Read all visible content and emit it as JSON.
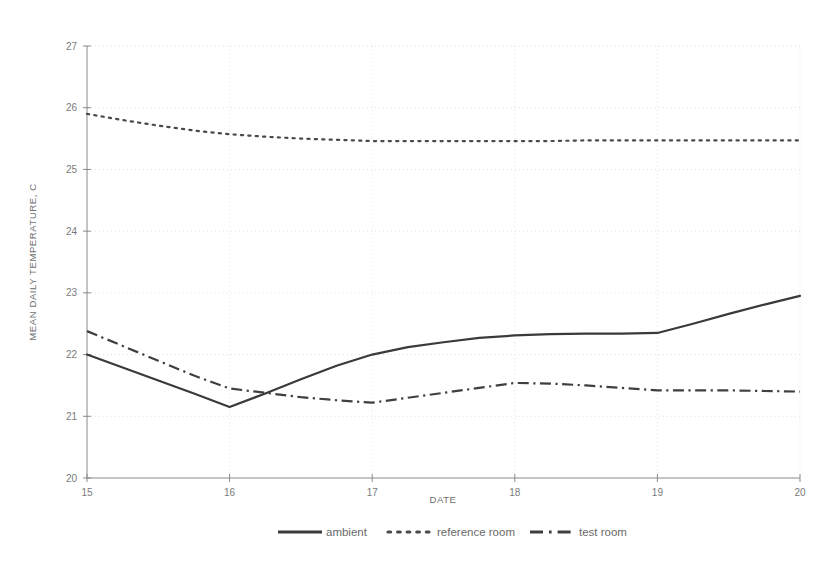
{
  "chart_data": {
    "type": "line",
    "title": "",
    "xlabel": "DATE",
    "ylabel": "MEAN DAILY TEMPERATURE, C",
    "xlim": [
      15,
      20
    ],
    "ylim": [
      20,
      27
    ],
    "xticks": [
      15,
      16,
      17,
      18,
      19,
      20
    ],
    "yticks": [
      20,
      21,
      22,
      23,
      24,
      25,
      26,
      27
    ],
    "xtick_labels": [
      "15",
      "16",
      "17",
      "18",
      "19",
      "20"
    ],
    "ytick_labels": [
      "20",
      "21",
      "22",
      "23",
      "24",
      "25",
      "26",
      "27"
    ],
    "grid": true,
    "legend_position": "bottom",
    "x": [
      15,
      15.25,
      15.5,
      15.75,
      16,
      16.25,
      16.5,
      16.75,
      17,
      17.25,
      17.5,
      17.75,
      18,
      18.25,
      18.5,
      18.75,
      19,
      19.25,
      19.5,
      19.75,
      20
    ],
    "series": [
      {
        "name": "ambient",
        "style": "solid",
        "color": "#3a3a3a",
        "values": [
          22.0,
          21.79,
          21.58,
          21.37,
          21.15,
          21.37,
          21.6,
          21.82,
          22.0,
          22.12,
          22.2,
          22.27,
          22.31,
          22.33,
          22.34,
          22.34,
          22.35,
          22.5,
          22.66,
          22.81,
          22.95
        ]
      },
      {
        "name": "reference room",
        "style": "dotted",
        "color": "#4a4a4a",
        "values": [
          25.9,
          25.8,
          25.71,
          25.63,
          25.57,
          25.53,
          25.5,
          25.48,
          25.46,
          25.46,
          25.46,
          25.46,
          25.46,
          25.46,
          25.47,
          25.47,
          25.47,
          25.47,
          25.47,
          25.47,
          25.47
        ]
      },
      {
        "name": "test room",
        "style": "dash-dot",
        "color": "#3f3f3f",
        "values": [
          22.38,
          22.14,
          21.9,
          21.66,
          21.45,
          21.38,
          21.31,
          21.26,
          21.22,
          21.3,
          21.38,
          21.46,
          21.54,
          21.53,
          21.5,
          21.46,
          21.42,
          21.42,
          21.42,
          21.41,
          21.4
        ]
      }
    ]
  },
  "legend": {
    "items": [
      {
        "label": "ambient",
        "style": "solid"
      },
      {
        "label": "reference room",
        "style": "dotted"
      },
      {
        "label": "test room",
        "style": "dash-dot"
      }
    ]
  }
}
